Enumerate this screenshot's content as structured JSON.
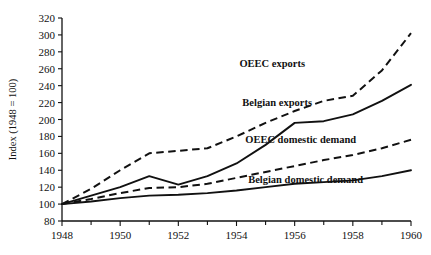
{
  "chart_data": {
    "type": "line",
    "title": "",
    "xlabel": "",
    "ylabel": "Index (1948 = 100)",
    "xlim": [
      1948,
      1960
    ],
    "ylim": [
      80,
      320
    ],
    "yticks": [
      80,
      100,
      120,
      140,
      160,
      180,
      200,
      220,
      240,
      260,
      280,
      300,
      320
    ],
    "xticks": [
      1948,
      1950,
      1952,
      1954,
      1956,
      1958,
      1960
    ],
    "xtick_labels": [
      "1948",
      "1950",
      "1952",
      "1954",
      "1956",
      "1958",
      "1960"
    ],
    "xticks_minor": [
      1949,
      1951,
      1953,
      1955,
      1957,
      1959
    ],
    "grid": false,
    "legend_position": "inline-annotations",
    "x": [
      1948,
      1949,
      1950,
      1951,
      1952,
      1953,
      1954,
      1955,
      1956,
      1957,
      1958,
      1959,
      1960
    ],
    "series": [
      {
        "name": "OEEC exports",
        "style": "dashed",
        "color": "#111111",
        "label_x": 1954.1,
        "label_y": 262,
        "values": [
          100,
          118,
          140,
          160,
          163,
          166,
          180,
          196,
          210,
          222,
          228,
          258,
          302
        ]
      },
      {
        "name": "Belgian exports",
        "style": "solid",
        "color": "#111111",
        "label_x": 1954.2,
        "label_y": 216,
        "values": [
          100,
          110,
          120,
          133,
          123,
          133,
          148,
          170,
          196,
          198,
          206,
          222,
          241
        ]
      },
      {
        "name": "OEEC domestic demand",
        "style": "dashed",
        "color": "#111111",
        "label_x": 1954.3,
        "label_y": 172,
        "values": [
          100,
          106,
          113,
          119,
          120,
          124,
          131,
          138,
          145,
          152,
          158,
          166,
          176
        ]
      },
      {
        "name": "Belgian domestic demand",
        "style": "solid",
        "color": "#111111",
        "label_x": 1954.4,
        "label_y": 125,
        "values": [
          100,
          103,
          107,
          110,
          111,
          113,
          116,
          120,
          124,
          126,
          128,
          133,
          140
        ]
      }
    ]
  },
  "axis": {
    "y_title": "Index (1948 = 100)"
  }
}
